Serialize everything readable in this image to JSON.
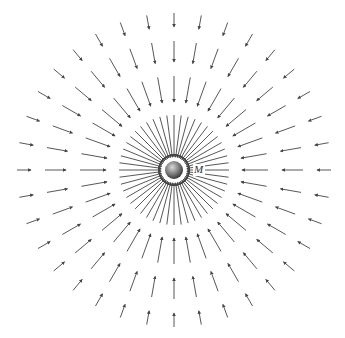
{
  "diagram": {
    "title": "",
    "type": "radial gravitational field of a point mass",
    "center": {
      "x": 174,
      "y": 170
    },
    "mass": {
      "label": "M",
      "radius": 9,
      "fill_light": "#d8d8d8",
      "fill_dark": "#3a3a3a",
      "label_position": {
        "x": 194,
        "y": 163
      }
    },
    "arrow_color": "#444444",
    "arrow_direction": "inward",
    "rings": [
      {
        "count": 48,
        "r_outer": 55,
        "r_inner": 13
      },
      {
        "count": 36,
        "r_outer": 94,
        "r_inner": 68
      },
      {
        "count": 36,
        "r_outer": 129,
        "r_inner": 108
      },
      {
        "count": 36,
        "r_outer": 157,
        "r_inner": 143
      }
    ]
  }
}
